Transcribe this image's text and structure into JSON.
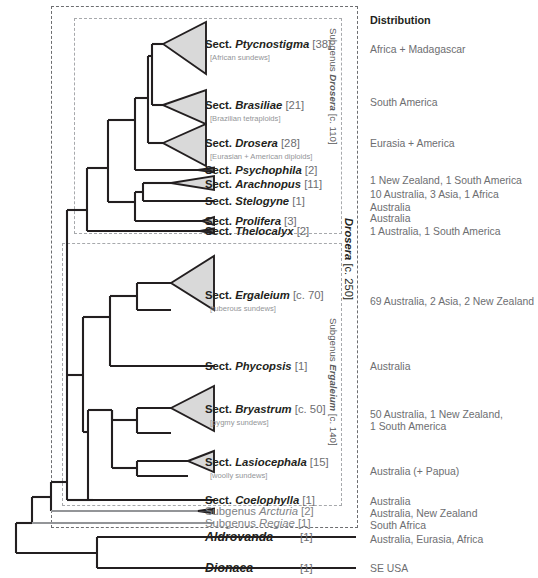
{
  "figure": {
    "distribution_header": "Distribution"
  },
  "brackets": [
    {
      "id": "subg-drosera",
      "text_main": "Subgenus ",
      "text_italic": "Drosera",
      "text_count": " [c. 110]"
    },
    {
      "id": "subg-ergaleium",
      "text_main": "Subgenus ",
      "text_italic": "Ergaleium",
      "text_count": " [c. 140]"
    },
    {
      "id": "genus-drosera",
      "text_main": "",
      "text_italic": "Drosera",
      "text_count": " [c. 250]"
    }
  ],
  "rows": [
    {
      "id": "ptycnostigma",
      "rank": "Sect. ",
      "name": "Ptycnostigma",
      "count": " [38]",
      "subtitle": "[African sundews]",
      "distribution": "Africa + Madagascar",
      "style": "dark",
      "clade": "triangle-large"
    },
    {
      "id": "brasiliae",
      "rank": "Sect. ",
      "name": "Brasiliae",
      "count": " [21]",
      "subtitle": "[Brazilian tetraploids]",
      "distribution": "South America",
      "style": "dark",
      "clade": "triangle-large"
    },
    {
      "id": "drosera",
      "rank": "Sect. ",
      "name": "Drosera",
      "count": " [28]",
      "subtitle": "[Eurasian + American diploids]",
      "distribution": "Eurasia + America",
      "style": "dark",
      "clade": "triangle-large"
    },
    {
      "id": "psychophila",
      "rank": "Sect. ",
      "name": "Psychophila",
      "count": " [2]",
      "subtitle": "",
      "distribution": "1 New Zealand, 1 South America",
      "style": "dark",
      "clade": "tip-small"
    },
    {
      "id": "arachnopus",
      "rank": "Sect. ",
      "name": "Arachnopus",
      "count": " [11]",
      "subtitle": "",
      "distribution": "10 Australia, 3 Asia, 1 Africa",
      "style": "dark",
      "clade": "triangle-small"
    },
    {
      "id": "stelogyne",
      "rank": "Sect. ",
      "name": "Stelogyne",
      "count": " [1]",
      "subtitle": "",
      "distribution": "Australia",
      "style": "dark",
      "clade": "tip-line"
    },
    {
      "id": "prolifera",
      "rank": "Sect. ",
      "name": "Prolifera",
      "count": " [3]",
      "subtitle": "",
      "distribution": "Australia",
      "style": "dark",
      "clade": "tip-small"
    },
    {
      "id": "thelocalyx",
      "rank": "Sect. ",
      "name": "Thelocalyx",
      "count": " [2]",
      "subtitle": "",
      "distribution": "1 Australia, 1 South America",
      "style": "dark",
      "clade": "tip-small"
    },
    {
      "id": "ergaleium",
      "rank": "Sect. ",
      "name": "Ergaleium",
      "count": " [c. 70]",
      "subtitle": "[tuberous sundews]",
      "distribution": "69 Australia, 2 Asia, 2 New Zealand",
      "style": "dark",
      "clade": "triangle-large"
    },
    {
      "id": "phycopsis",
      "rank": "Sect. ",
      "name": "Phycopsis",
      "count": " [1]",
      "subtitle": "",
      "distribution": "Australia",
      "style": "dark",
      "clade": "tip-line"
    },
    {
      "id": "bryastrum",
      "rank": "Sect. ",
      "name": "Bryastrum",
      "count": " [c. 50]",
      "subtitle": "[pygmy sundews]",
      "distribution": "50 Australia, 1 New Zealand,\n1 South America",
      "style": "dark",
      "clade": "triangle-large"
    },
    {
      "id": "lasiocephala",
      "rank": "Sect. ",
      "name": "Lasiocephala",
      "count": " [15]",
      "subtitle": "[woolly sundews]",
      "distribution": "Australia (+ Papua)",
      "style": "dark",
      "clade": "triangle-med"
    },
    {
      "id": "coelophylla",
      "rank": "Sect. ",
      "name": "Coelophylla",
      "count": " [1]",
      "subtitle": "",
      "distribution": "Australia",
      "style": "dark",
      "clade": "tip-line"
    },
    {
      "id": "arcturia",
      "rank": "Subgenus ",
      "name": "Arcturia",
      "count": " [2]",
      "subtitle": "",
      "distribution": "Australia, New Zealand",
      "style": "grey",
      "clade": "tip-small"
    },
    {
      "id": "regiae",
      "rank": "Subgenus ",
      "name": "Regiae",
      "count": "  [1]",
      "subtitle": "",
      "distribution": "South Africa",
      "style": "grey",
      "clade": "tip-line"
    },
    {
      "id": "aldrovanda",
      "rank": "",
      "name": "Aldrovanda",
      "count": "[1]",
      "subtitle": "",
      "distribution": "Australia, Eurasia, Africa",
      "style": "genus",
      "clade": "tip-line"
    },
    {
      "id": "dionaea",
      "rank": "",
      "name": "Dionaea",
      "count": "[1]",
      "subtitle": "",
      "distribution": "SE USA",
      "style": "genus",
      "clade": "tip-line"
    }
  ],
  "colors": {
    "clade_fill": "#d9d9d9",
    "branch": "#231f20",
    "branch_grey": "#939598",
    "dash": "#a7a9ac",
    "text_dark": "#231f20",
    "text_grey": "#808285",
    "text_sub": "#939598"
  }
}
